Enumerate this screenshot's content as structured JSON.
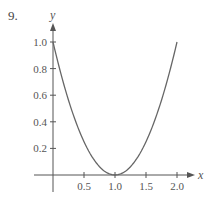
{
  "problem_number": "9.",
  "chart_data": {
    "type": "line",
    "title": "",
    "xlabel": "x",
    "ylabel": "y",
    "xlim": [
      0,
      2.2
    ],
    "ylim": [
      0,
      1.1
    ],
    "grid": false,
    "legend": null,
    "x_ticks": [
      "0.5",
      "1.0",
      "1.5",
      "2.0"
    ],
    "y_ticks": [
      "0.2",
      "0.4",
      "0.6",
      "0.8",
      "1.0"
    ],
    "series": [
      {
        "name": "curve",
        "description": "parabola y = (x - 1)^2",
        "x": [
          0,
          0.25,
          0.5,
          0.75,
          1.0,
          1.25,
          1.5,
          1.75,
          2.0
        ],
        "y": [
          1.0,
          0.5625,
          0.25,
          0.0625,
          0.0,
          0.0625,
          0.25,
          0.5625,
          1.0
        ]
      }
    ],
    "colors": {
      "axis": "#555555",
      "curve": "#666666",
      "text": "#555555"
    }
  }
}
